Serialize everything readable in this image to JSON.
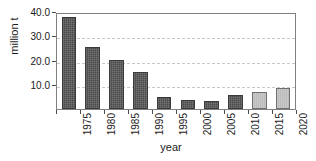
{
  "chart_data": {
    "type": "bar",
    "title": "",
    "subtitle": "",
    "xlabel": "year",
    "ylabel": "million t",
    "categories": [
      "1975",
      "1980",
      "1985",
      "1990",
      "1995",
      "2000",
      "2005",
      "2010",
      "2015",
      "2020"
    ],
    "values": [
      38.0,
      25.5,
      20.3,
      15.3,
      4.8,
      3.6,
      3.3,
      5.6,
      7.2,
      8.6
    ],
    "bar_colors": [
      "dark",
      "dark",
      "dark",
      "dark",
      "dark",
      "dark",
      "dark",
      "dark",
      "light",
      "light"
    ],
    "ylim": [
      0,
      40
    ],
    "yticks": [
      10.0,
      20.0,
      30.0,
      40.0
    ],
    "ytick_labels": [
      "10.0",
      "20.0",
      "30.0",
      "40.0"
    ],
    "grid": "horizontal-dashed",
    "legend": "none",
    "annotations": [],
    "colors": {
      "bar_dark": "#4a4a4a",
      "bar_light": "#bcbcbc",
      "grid": "#c8c8c8",
      "axis": "#808080",
      "text": "#1a1a1a"
    }
  }
}
